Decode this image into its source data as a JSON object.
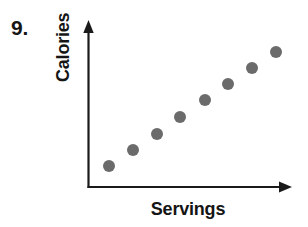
{
  "problem": {
    "number_label": "9."
  },
  "chart_data": {
    "type": "scatter",
    "title": "",
    "xlabel": "Servings",
    "ylabel": "Calories",
    "grid": false,
    "legend": false,
    "axis_style": "arrowed-L-axes",
    "tick_labels_x": [],
    "tick_labels_y": [],
    "xlim": [
      0,
      10
    ],
    "ylim": [
      0,
      10
    ],
    "point_color": "#6b6b6b",
    "axis_color": "#1a1a1a",
    "point_radius_px": 6,
    "relationship": "positive linear",
    "series": [
      {
        "name": "Calories vs Servings",
        "points": [
          {
            "x": 1,
            "y": 1
          },
          {
            "x": 2,
            "y": 2
          },
          {
            "x": 3,
            "y": 3
          },
          {
            "x": 4,
            "y": 4
          },
          {
            "x": 5,
            "y": 5
          },
          {
            "x": 6,
            "y": 6
          },
          {
            "x": 7,
            "y": 7
          },
          {
            "x": 8,
            "y": 8
          }
        ],
        "pixel_points": [
          {
            "cx": 109,
            "cy": 166
          },
          {
            "cx": 133,
            "cy": 150
          },
          {
            "cx": 157,
            "cy": 134
          },
          {
            "cx": 180,
            "cy": 117
          },
          {
            "cx": 205,
            "cy": 100
          },
          {
            "cx": 228,
            "cy": 84
          },
          {
            "cx": 252,
            "cy": 68
          },
          {
            "cx": 276,
            "cy": 52
          }
        ]
      }
    ]
  },
  "colors": {
    "background": "#ffffff",
    "ink": "#151515",
    "marker": "#6b6b6b",
    "axis": "#1a1a1a"
  }
}
